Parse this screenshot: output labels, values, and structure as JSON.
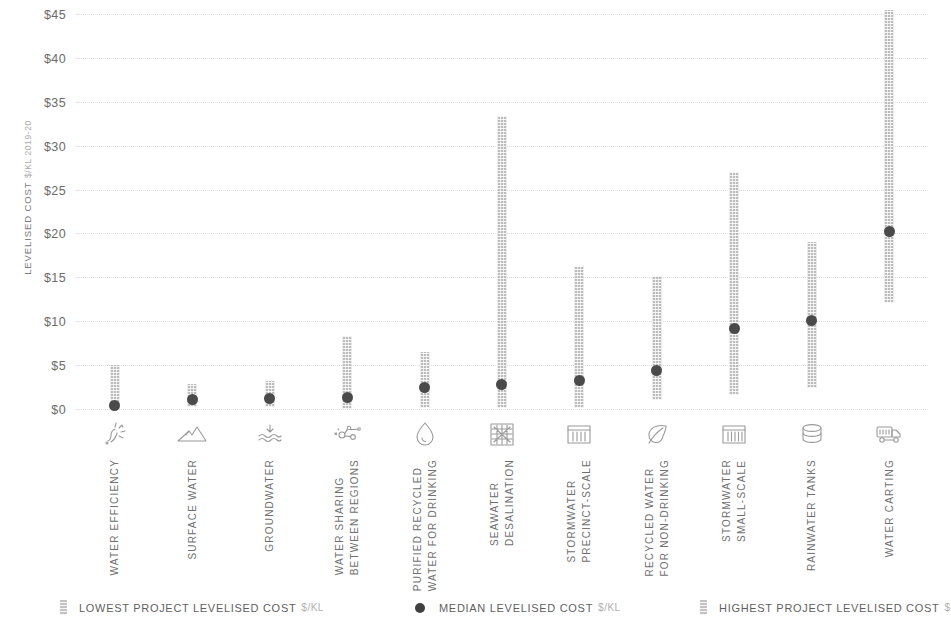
{
  "chart_data": {
    "type": "bar",
    "title": "",
    "subtitle": "",
    "xlabel": "",
    "ylabel": "LEVELISED COST",
    "ylabel_unit": "$/KL 2019-20",
    "ylim": [
      0,
      45
    ],
    "ytick_values": [
      0,
      5,
      10,
      15,
      20,
      25,
      30,
      35,
      40,
      45
    ],
    "ytick_labels": [
      "$0",
      "$5",
      "$10",
      "$15",
      "$20",
      "$25",
      "$30",
      "$35",
      "$40",
      "$45"
    ],
    "grid": true,
    "legend_position": "bottom",
    "value_axis_clipped_above": 45,
    "categories": [
      "WATER EFFICIENCY",
      "SURFACE WATER",
      "GROUNDWATER",
      "WATER SHARING\nBETWEEN REGIONS",
      "PURIFIED RECYCLED\nWATER FOR DRINKING",
      "SEAWATER\nDESALINATION",
      "STORMWATER\nPRECINCT-SCALE",
      "RECYCLED WATER\nFOR NON-DRINKING",
      "STORMWATER\nSMALL-SCALE",
      "RAINWATER TANKS",
      "WATER CARTING"
    ],
    "category_icons": [
      "water-efficiency-icon",
      "mountains-surface-water-icon",
      "groundwater-icon",
      "water-sharing-network-icon",
      "water-droplet-icon",
      "desalination-membrane-icon",
      "stormwater-precinct-icon",
      "recycled-leaf-icon",
      "stormwater-small-scale-icon",
      "rainwater-tank-icon",
      "water-carting-truck-icon"
    ],
    "series": [
      {
        "name": "LOWEST PROJECT LEVELISED COST",
        "unit": "$/KL",
        "marker": "bar-bottom",
        "values": [
          0.0,
          0.2,
          0.2,
          0.0,
          0.1,
          0.1,
          0.1,
          1.0,
          1.6,
          2.4,
          12.1
        ]
      },
      {
        "name": "MEDIAN LEVELISED COST",
        "unit": "$/KL",
        "marker": "dot",
        "values": [
          0.4,
          1.1,
          1.2,
          1.3,
          2.5,
          2.8,
          3.2,
          4.4,
          9.2,
          10.1,
          20.2
        ]
      },
      {
        "name": "HIGHEST PROJECT LEVELISED COST",
        "unit": "$/KL",
        "marker": "bar-top",
        "values": [
          5.0,
          2.8,
          3.2,
          8.3,
          6.5,
          33.4,
          16.3,
          15.1,
          27.0,
          19.0,
          48.0
        ]
      }
    ]
  },
  "legend": {
    "items": [
      {
        "label": "LOWEST PROJECT LEVELISED COST",
        "unit": "$/KL",
        "marker": "bar-swatch"
      },
      {
        "label": "MEDIAN LEVELISED COST",
        "unit": "$/KL",
        "marker": "dot-swatch"
      },
      {
        "label": "HIGHEST PROJECT LEVELISED COST",
        "unit": "$",
        "marker": "bar-swatch"
      }
    ]
  },
  "colors": {
    "bar": "#b9b9b9",
    "median_dot": "#4a4a4a",
    "gridline": "#dcdcdc",
    "text": "#6e6e6e",
    "icon": "#9a9a9a",
    "background": "#ffffff"
  }
}
